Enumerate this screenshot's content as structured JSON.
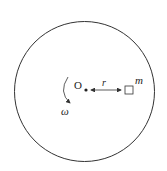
{
  "diagram": {
    "center_label": "O",
    "radius_label": "r",
    "mass_label": "m",
    "angular_velocity_label": "ω",
    "colors": {
      "stroke": "#333333",
      "background": "#ffffff"
    }
  }
}
